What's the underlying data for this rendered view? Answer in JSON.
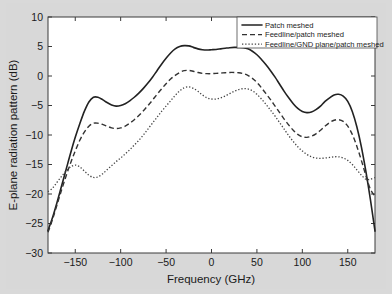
{
  "chart_data": {
    "type": "line",
    "title": "",
    "xlabel": "Frequency (GHz)",
    "ylabel": "E-plane radiation pattern (dB)",
    "xlim": [
      -180,
      180
    ],
    "ylim": [
      -30,
      10
    ],
    "xticks": [
      -150,
      -100,
      -50,
      0,
      50,
      100,
      150
    ],
    "xticklabels": [
      "-150",
      "-100",
      "-50",
      "0",
      "50",
      "100",
      "150"
    ],
    "yticks": [
      -30,
      -25,
      -20,
      -15,
      -10,
      -5,
      0,
      5,
      10
    ],
    "yticklabels": [
      "-30",
      "-25",
      "-20",
      "-15",
      "-10",
      "-5",
      "0",
      "5",
      "10"
    ],
    "grid": false,
    "legend_position": "upper right",
    "series": [
      {
        "name": "Patch meshed",
        "style": "solid",
        "color": "#222222",
        "x": [
          -180,
          -175,
          -170,
          -165,
          -160,
          -155,
          -150,
          -145,
          -140,
          -135,
          -130,
          -125,
          -120,
          -115,
          -110,
          -105,
          -100,
          -95,
          -90,
          -85,
          -80,
          -75,
          -70,
          -65,
          -60,
          -55,
          -50,
          -45,
          -40,
          -35,
          -30,
          -25,
          -20,
          -15,
          -10,
          -5,
          0,
          5,
          10,
          15,
          20,
          25,
          30,
          35,
          40,
          45,
          50,
          55,
          60,
          65,
          70,
          75,
          80,
          85,
          90,
          95,
          100,
          105,
          110,
          115,
          120,
          125,
          130,
          135,
          140,
          145,
          150,
          155,
          160,
          165,
          170,
          175,
          180
        ],
        "y": [
          -26.2,
          -24.0,
          -21.4,
          -18.6,
          -15.8,
          -13.0,
          -10.4,
          -8.1,
          -6.0,
          -4.4,
          -3.6,
          -3.6,
          -4.0,
          -4.5,
          -4.9,
          -5.1,
          -5.0,
          -4.7,
          -4.2,
          -3.6,
          -2.9,
          -2.1,
          -1.2,
          -0.2,
          0.9,
          2.0,
          3.0,
          3.9,
          4.6,
          5.0,
          5.15,
          5.1,
          4.85,
          4.6,
          4.45,
          4.4,
          4.45,
          4.5,
          4.6,
          4.7,
          4.8,
          4.85,
          4.85,
          4.8,
          4.6,
          4.2,
          3.6,
          2.8,
          1.9,
          0.9,
          -0.2,
          -1.4,
          -2.6,
          -3.7,
          -4.7,
          -5.5,
          -6.0,
          -6.2,
          -6.1,
          -5.7,
          -5.1,
          -4.3,
          -3.7,
          -3.2,
          -3.1,
          -3.4,
          -4.3,
          -6.0,
          -8.6,
          -12.0,
          -16.2,
          -21.0,
          -26.3
        ]
      },
      {
        "name": "Feedline/patch meshed",
        "style": "dashed",
        "color": "#333333",
        "x": [
          -180,
          -175,
          -170,
          -165,
          -160,
          -155,
          -150,
          -145,
          -140,
          -135,
          -130,
          -125,
          -120,
          -115,
          -110,
          -105,
          -100,
          -95,
          -90,
          -85,
          -80,
          -75,
          -70,
          -65,
          -60,
          -55,
          -50,
          -45,
          -40,
          -35,
          -30,
          -25,
          -20,
          -15,
          -10,
          -5,
          0,
          5,
          10,
          15,
          20,
          25,
          30,
          35,
          40,
          45,
          50,
          55,
          60,
          65,
          70,
          75,
          80,
          85,
          90,
          95,
          100,
          105,
          110,
          115,
          120,
          125,
          130,
          135,
          140,
          145,
          150,
          155,
          160,
          165,
          170,
          175,
          180
        ],
        "y": [
          -26.5,
          -24.3,
          -21.8,
          -19.3,
          -16.9,
          -14.7,
          -12.7,
          -10.9,
          -9.5,
          -8.5,
          -8.0,
          -8.0,
          -8.2,
          -8.5,
          -8.8,
          -8.9,
          -8.8,
          -8.5,
          -8.0,
          -7.4,
          -6.7,
          -5.9,
          -5.0,
          -4.1,
          -3.1,
          -2.2,
          -1.3,
          -0.5,
          0.1,
          0.6,
          0.9,
          0.95,
          0.8,
          0.6,
          0.45,
          0.4,
          0.4,
          0.45,
          0.5,
          0.55,
          0.6,
          0.6,
          0.55,
          0.4,
          0.1,
          -0.4,
          -1.1,
          -2.0,
          -3.0,
          -4.0,
          -5.1,
          -6.2,
          -7.3,
          -8.3,
          -9.2,
          -9.9,
          -10.3,
          -10.4,
          -10.2,
          -9.8,
          -9.2,
          -8.5,
          -7.9,
          -7.5,
          -7.4,
          -7.7,
          -8.5,
          -9.9,
          -11.9,
          -14.3,
          -16.9,
          -19.2,
          -20.4
        ]
      },
      {
        "name": "Feedline/GND plane/patch meshed",
        "style": "dotted",
        "color": "#444444",
        "x": [
          -180,
          -175,
          -170,
          -165,
          -160,
          -155,
          -150,
          -145,
          -140,
          -135,
          -130,
          -125,
          -120,
          -115,
          -110,
          -105,
          -100,
          -95,
          -90,
          -85,
          -80,
          -75,
          -70,
          -65,
          -60,
          -55,
          -50,
          -45,
          -40,
          -35,
          -30,
          -25,
          -20,
          -15,
          -10,
          -5,
          0,
          5,
          10,
          15,
          20,
          25,
          30,
          35,
          40,
          45,
          50,
          55,
          60,
          65,
          70,
          75,
          80,
          85,
          90,
          95,
          100,
          105,
          110,
          115,
          120,
          125,
          130,
          135,
          140,
          145,
          150,
          155,
          160,
          165,
          170,
          175,
          180
        ],
        "y": [
          -19.6,
          -19.0,
          -18.0,
          -17.0,
          -16.1,
          -15.4,
          -15.1,
          -15.4,
          -16.1,
          -16.8,
          -17.2,
          -17.1,
          -16.6,
          -15.9,
          -15.2,
          -14.5,
          -13.9,
          -13.2,
          -12.5,
          -11.7,
          -10.9,
          -10.0,
          -9.0,
          -8.0,
          -7.0,
          -6.0,
          -5.1,
          -4.2,
          -3.3,
          -2.5,
          -2.0,
          -1.85,
          -2.1,
          -2.6,
          -3.2,
          -3.7,
          -3.9,
          -3.9,
          -3.7,
          -3.4,
          -3.0,
          -2.6,
          -2.3,
          -2.15,
          -2.2,
          -2.5,
          -3.1,
          -3.9,
          -4.8,
          -5.8,
          -6.8,
          -7.9,
          -9.0,
          -10.1,
          -11.1,
          -12.0,
          -12.7,
          -13.3,
          -13.7,
          -13.9,
          -13.95,
          -13.9,
          -13.8,
          -13.7,
          -13.7,
          -13.9,
          -14.3,
          -15.0,
          -15.9,
          -16.8,
          -17.5,
          -17.5,
          -17.2
        ]
      }
    ]
  },
  "legend": {
    "items": [
      {
        "label": "Patch meshed",
        "style": "solid"
      },
      {
        "label": "Feedline/patch meshed",
        "style": "dashed"
      },
      {
        "label": "Feedline/GND plane/patch meshed",
        "style": "dotted"
      }
    ]
  },
  "colors": {
    "figure_background": "#d8d8d8",
    "axes_background": "#ffffff",
    "axis": "#3a3a3a",
    "text": "#1a1a1a"
  }
}
